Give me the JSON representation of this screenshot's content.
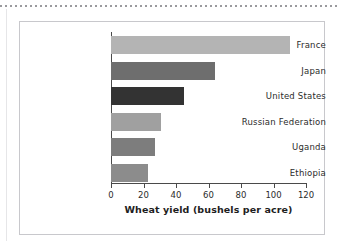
{
  "figure": {
    "background_color": "#ffffff",
    "frame_color": "#c8c8cc",
    "top_rule_color": "#9a9a9e"
  },
  "chart_data": {
    "type": "bar",
    "orientation": "horizontal",
    "title": "",
    "subtitle": "",
    "xlabel": "Wheat yield (bushels per acre)",
    "ylabel": "",
    "categories": [
      "France",
      "Japan",
      "United States",
      "Russian Federation",
      "Uganda",
      "Ethiopia"
    ],
    "values": [
      110,
      64,
      45,
      31,
      27,
      23
    ],
    "bar_colors": [
      "#b4b4b4",
      "#6e6e6e",
      "#333333",
      "#a0a0a0",
      "#7d7d7d",
      "#8c8c8c"
    ],
    "xlim": [
      0,
      120
    ],
    "xticks": [
      0,
      20,
      40,
      60,
      80,
      100,
      120
    ],
    "xtick_labels": [
      "0",
      "20",
      "40",
      "60",
      "80",
      "100",
      "120"
    ],
    "grid": false,
    "legend": "none",
    "axis_color": "#4a4a4a"
  }
}
